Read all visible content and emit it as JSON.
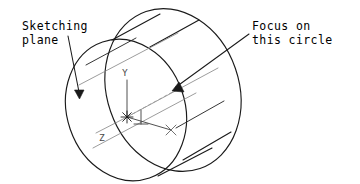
{
  "figure": {
    "background_color": "#ffffff",
    "line_color": "#1a1a1a",
    "faint_line_color": "#8a8a8a",
    "width": 360,
    "height": 184
  },
  "annotations": {
    "sketching_plane": {
      "line1": "Sketching",
      "line2": "plane",
      "x": 22,
      "y": 30
    },
    "focus_circle": {
      "line1": "Focus on",
      "line2": "this circle",
      "x": 252,
      "y": 30
    }
  },
  "axes": {
    "y_label": "Y",
    "z_label": "Z",
    "origin_marker": "asterisk-marker",
    "x_marker": "x-marker"
  },
  "geometry": {
    "front_circle_name": "sketching-plane-circle",
    "back_circle_name": "focus-circle",
    "body_name": "cylinder-body"
  }
}
